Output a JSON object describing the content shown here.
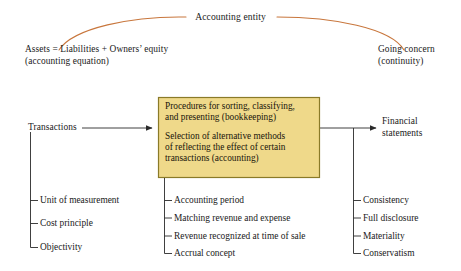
{
  "diagram": {
    "title": "Accounting entity",
    "colors": {
      "arc": "#c8763c",
      "box_fill": "#efd98a",
      "box_border": "#8a7a28",
      "line": "#2a2a2a",
      "text": "#1a1a1a",
      "background": "#ffffff"
    },
    "top": {
      "arc_label": "Accounting entity",
      "left_anchor": {
        "line1": "Assets = Liabilities + Owners’ equity",
        "line2": "(accounting equation)"
      },
      "right_anchor": {
        "line1": "Going concern",
        "line2": "(continuity)"
      }
    },
    "flow": {
      "input_label": "Transactions",
      "output_label_line1": "Financial",
      "output_label_line2": "statements"
    },
    "center_box": {
      "paragraph1": "Procedures for sorting, classifying, and presenting (bookkeeping)",
      "paragraph1_line1": "Procedures for sorting, classifying,",
      "paragraph1_line2": "and presenting (bookkeeping)",
      "paragraph2": "Selection of alternative methods of reflecting the effect of certain transactions (accounting)",
      "paragraph2_line1": "Selection of alternative methods",
      "paragraph2_line2": "of reflecting the effect of certain",
      "paragraph2_line3": "transactions (accounting)"
    },
    "lists": {
      "left": {
        "items": [
          "Unit of measurement",
          "Cost principle",
          "Objectivity"
        ]
      },
      "middle": {
        "items": [
          "Accounting period",
          "Matching revenue and expense",
          "Revenue recognized at time of sale",
          "Accrual concept"
        ]
      },
      "right": {
        "items": [
          "Consistency",
          "Full disclosure",
          "Materiality",
          "Conservatism"
        ]
      }
    }
  }
}
